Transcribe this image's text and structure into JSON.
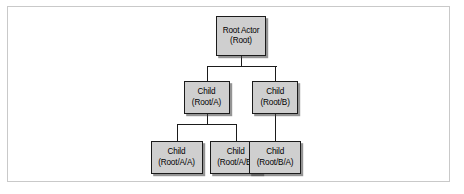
{
  "figure": {
    "type": "tree-diagram",
    "background_color": "#ffffff",
    "frame_border_color": "#c9c9c9",
    "node_fill_color": "#cfcfcf",
    "node_border_color": "#1b1b1b",
    "connector_color": "#1b1b1b"
  },
  "nodes": {
    "root": {
      "title": "Root Actor",
      "path": "(Root)"
    },
    "child_a": {
      "title": "Child",
      "path": "(Root/A)"
    },
    "child_b": {
      "title": "Child",
      "path": "(Root/B)"
    },
    "child_aa": {
      "title": "Child",
      "path": "(Root/A/A)"
    },
    "child_ab": {
      "title": "Child",
      "path": "(Root/A/B)"
    },
    "child_ba": {
      "title": "Child",
      "path": "(Root/B/A)"
    }
  },
  "edges": [
    {
      "from": "root",
      "to": "child_a"
    },
    {
      "from": "root",
      "to": "child_b"
    },
    {
      "from": "child_a",
      "to": "child_aa"
    },
    {
      "from": "child_a",
      "to": "child_ab"
    },
    {
      "from": "child_b",
      "to": "child_ba"
    }
  ]
}
